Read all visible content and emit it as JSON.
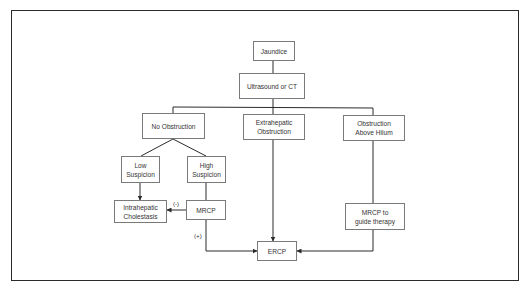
{
  "diagram": {
    "type": "flowchart",
    "nodes": {
      "jaundice": "Jaundice",
      "imaging": "Ultrasound or CT",
      "no_obstruction": "No Obstruction",
      "extrahepatic": "Extrahepatic\nObstruction",
      "above_hilum": "Obstruction\nAbove Hilum",
      "low_suspicion": "Low\nSuspicion",
      "high_suspicion": "High\nSuspicion",
      "intrahepatic": "Intrahepatic\nCholestasis",
      "mrcp": "MRCP",
      "mrcp_guide": "MRCP to\nguide therapy",
      "ercp": "ERCP"
    },
    "edge_labels": {
      "negative": "(-)",
      "positive": "(+)"
    },
    "edges": [
      {
        "from": "jaundice",
        "to": "imaging"
      },
      {
        "from": "imaging",
        "to": "no_obstruction"
      },
      {
        "from": "imaging",
        "to": "extrahepatic"
      },
      {
        "from": "imaging",
        "to": "above_hilum"
      },
      {
        "from": "no_obstruction",
        "to": "low_suspicion"
      },
      {
        "from": "no_obstruction",
        "to": "high_suspicion"
      },
      {
        "from": "low_suspicion",
        "to": "intrahepatic"
      },
      {
        "from": "high_suspicion",
        "to": "mrcp"
      },
      {
        "from": "mrcp",
        "to": "intrahepatic",
        "label": "(-)"
      },
      {
        "from": "mrcp",
        "to": "ercp",
        "label": "(+)"
      },
      {
        "from": "extrahepatic",
        "to": "ercp"
      },
      {
        "from": "above_hilum",
        "to": "mrcp_guide"
      },
      {
        "from": "mrcp_guide",
        "to": "ercp"
      }
    ],
    "colors": {
      "line": "#2b2b2b",
      "box_border": "#7a7a7a",
      "text": "#333333"
    }
  }
}
